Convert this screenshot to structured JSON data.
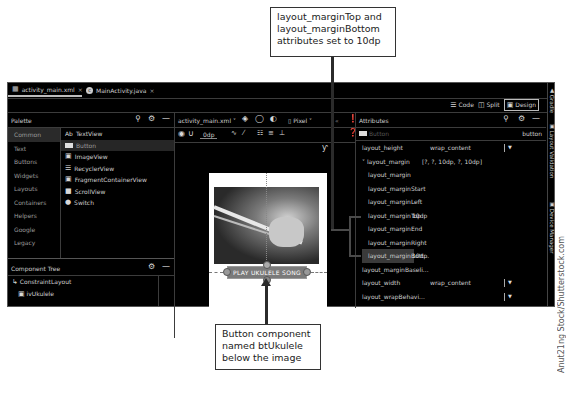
{
  "callouts": {
    "top": {
      "lines": [
        "layout_marginTop and",
        "layout_marginBottom",
        "attributes set to 10dp"
      ]
    },
    "bottom": {
      "lines": [
        "Button component",
        "named btUkulele",
        "below the image"
      ]
    }
  },
  "credit": "Anut21ng Stock/Shutterstock.com",
  "editor_tabs": [
    {
      "label": "activity_main.xml",
      "icon": "layout-file-icon",
      "active": true
    },
    {
      "label": "MainActivity.java",
      "icon": "java-class-icon",
      "active": false
    }
  ],
  "view_modes": {
    "code": "Code",
    "split": "Split",
    "design": "Design",
    "selected": "Design"
  },
  "right_strip": [
    "Gradle",
    "Layout Validation",
    "Device Manager"
  ],
  "palette": {
    "title": "Palette",
    "categories": [
      "Common",
      "Text",
      "Buttons",
      "Widgets",
      "Layouts",
      "Containers",
      "Helpers",
      "Google",
      "Legacy"
    ],
    "selected_category": "Common",
    "items": [
      {
        "icon": "Ab",
        "label": "TextView"
      },
      {
        "icon": "button-icon",
        "label": "Button"
      },
      {
        "icon": "image-icon",
        "label": "ImageView"
      },
      {
        "icon": "list-icon",
        "label": "RecyclerView"
      },
      {
        "icon": "fragment-icon",
        "label": "FragmentContainerView"
      },
      {
        "icon": "scroll-icon",
        "label": "ScrollView"
      },
      {
        "icon": "switch-icon",
        "label": "Switch"
      }
    ],
    "selected_item": "Button"
  },
  "component_tree": {
    "title": "Component Tree",
    "items": [
      "ConstraintLayout",
      "ivUkulele"
    ]
  },
  "design_toolbar": {
    "file": "activity_main.xml",
    "device": "Pixel",
    "margin": "0dp"
  },
  "canvas": {
    "button_text": "PLAY UKULELE SONG"
  },
  "attributes": {
    "title": "Attributes",
    "component_type": "Button",
    "component_id": "button",
    "rows": [
      {
        "key": "layout_height",
        "value": "wrap_content",
        "dropdown": true,
        "indent": 0
      },
      {
        "key": "layout_margin",
        "value": "[?, ?, 10dp, ?, 10dp]",
        "dropdown": false,
        "indent": 0,
        "expanded": true
      },
      {
        "key": "layout_margin",
        "value": "",
        "dropdown": false,
        "indent": 1
      },
      {
        "key": "layout_marginStart",
        "value": "",
        "dropdown": false,
        "indent": 1
      },
      {
        "key": "layout_marginLeft",
        "value": "",
        "dropdown": false,
        "indent": 1
      },
      {
        "key": "layout_marginTop",
        "value": "10dp",
        "dropdown": false,
        "indent": 1
      },
      {
        "key": "layout_marginEnd",
        "value": "",
        "dropdown": false,
        "indent": 1
      },
      {
        "key": "layout_marginRight",
        "value": "",
        "dropdown": false,
        "indent": 1
      },
      {
        "key": "layout_marginBott...",
        "value": "10dp",
        "dropdown": false,
        "indent": 1,
        "selected": true
      },
      {
        "key": "layout_marginBaseli...",
        "value": "",
        "dropdown": false,
        "indent": 0
      },
      {
        "key": "layout_width",
        "value": "wrap_content",
        "dropdown": true,
        "indent": 0
      },
      {
        "key": "layout_wrapBehavi...",
        "value": "",
        "dropdown": true,
        "indent": 0
      }
    ]
  }
}
